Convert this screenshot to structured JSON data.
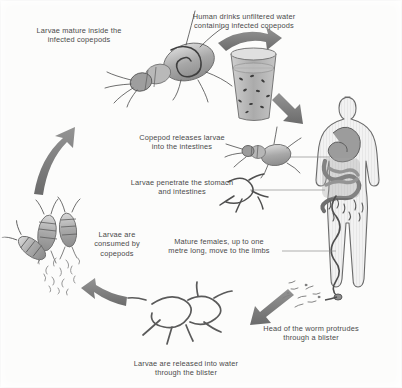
{
  "figure": {
    "background_color": "#fcfcfb",
    "text_color": "#4a4a4a",
    "arrow_color": "#6e6e6e",
    "organ_color": "#9a9a9a",
    "body_outline_color": "#6a6a6a"
  },
  "labels": {
    "larvae_mature": "Larvae mature inside the\ninfected copepods",
    "human_drinks": "Human drinks unfiltered water\ncontaining infected copepods",
    "copepod_releases": "Copepod releases larvae\ninto the intestines",
    "larvae_penetrate": "Larvae penetrate the stomach\nand intestines",
    "mature_females": "Mature females, up to one\nmetre long, move to the limbs",
    "head_protrudes": "Head of the worm protrudes\nthrough a blister",
    "larvae_released": "Larvae are released into water\nthrough the blister",
    "larvae_consumed": "Larvae are\nconsumed by\ncopepods"
  },
  "elements": {
    "copepod_top": "copepod-with-larva",
    "glass": "glass-of-unfiltered-water",
    "human": "human-body-silhouette",
    "copepod_intestine": "copepod-releasing-larvae",
    "larvae_penetrating": "larvae-worms",
    "worm_tangle": "tangled-adult-worms",
    "copepod_cluster": "copepods-consuming-larvae",
    "blister_larvae": "larvae-cloud-at-blister"
  },
  "arrows": [
    {
      "name": "arrow-copepod-to-glass",
      "direction": "right"
    },
    {
      "name": "arrow-glass-to-human",
      "direction": "down-right"
    },
    {
      "name": "arrow-human-to-worms",
      "direction": "down-left"
    },
    {
      "name": "arrow-worms-to-copepods",
      "direction": "left"
    },
    {
      "name": "arrow-copepods-to-copepod-top",
      "direction": "up"
    }
  ]
}
